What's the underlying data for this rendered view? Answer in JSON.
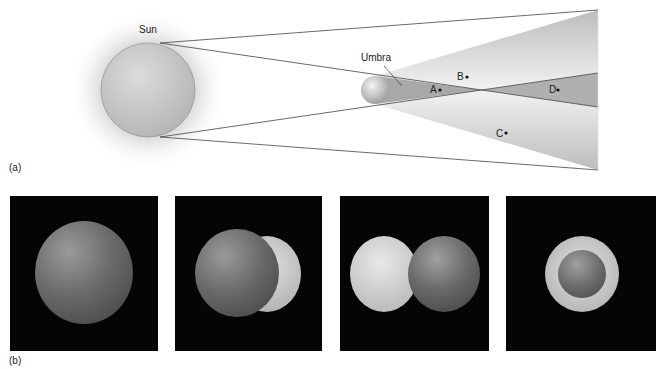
{
  "part_a": {
    "label": "(a)",
    "sun_label": "Sun",
    "umbra_label": "Umbra",
    "points": [
      {
        "label": "A",
        "x": 436,
        "y": 89
      },
      {
        "label": "B",
        "x": 464,
        "y": 76
      },
      {
        "label": "C",
        "x": 504,
        "y": 133
      },
      {
        "label": "D",
        "x": 557,
        "y": 89
      }
    ],
    "colors": {
      "penumbra": "#c8c8c8",
      "umbra": "#a8a8a8",
      "lines": "#444444"
    }
  },
  "part_b": {
    "label": "(b)",
    "panels": [
      {
        "description": "moon-fully-covering"
      },
      {
        "description": "moon-partially-covering-right"
      },
      {
        "description": "moon-partially-covering-left"
      },
      {
        "description": "annular-ring"
      }
    ]
  }
}
